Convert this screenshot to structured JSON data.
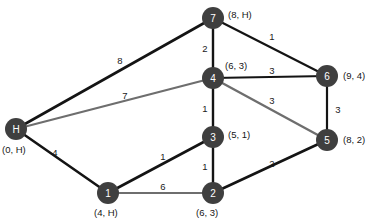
{
  "diagram": {
    "node_fill_color": "#3f3f3f",
    "node_text_color": "#ffffff",
    "label_text_color": "#161616",
    "edge_dark_color": "#141414",
    "edge_light_color": "#6e6e6e",
    "background_color": "#ffffff"
  },
  "nodes": [
    {
      "id": "H",
      "label": "H",
      "tuple": "(0, H)",
      "x": 16,
      "y": 129,
      "r": 11,
      "tuple_x": 2,
      "tuple_y": 153,
      "tuple_anchor": "start"
    },
    {
      "id": "7",
      "label": "7",
      "tuple": "(8, H)",
      "x": 213,
      "y": 18,
      "r": 11,
      "tuple_x": 228,
      "tuple_y": 18,
      "tuple_anchor": "start"
    },
    {
      "id": "4",
      "label": "4",
      "tuple": "(6, 3)",
      "x": 213,
      "y": 78,
      "r": 11,
      "tuple_x": 225,
      "tuple_y": 69,
      "tuple_anchor": "start"
    },
    {
      "id": "6",
      "label": "6",
      "tuple": "(9, 4)",
      "x": 327,
      "y": 76,
      "r": 11,
      "tuple_x": 343,
      "tuple_y": 79,
      "tuple_anchor": "start"
    },
    {
      "id": "5",
      "label": "5",
      "tuple": "(8, 2)",
      "x": 327,
      "y": 140,
      "r": 11,
      "tuple_x": 343,
      "tuple_y": 143,
      "tuple_anchor": "start"
    },
    {
      "id": "3",
      "label": "3",
      "tuple": "(5, 1)",
      "x": 213,
      "y": 137,
      "r": 11,
      "tuple_x": 228,
      "tuple_y": 138,
      "tuple_anchor": "start"
    },
    {
      "id": "1",
      "label": "1",
      "tuple": "(4, H)",
      "x": 108,
      "y": 193,
      "r": 11,
      "tuple_x": 94,
      "tuple_y": 216,
      "tuple_anchor": "start"
    },
    {
      "id": "2",
      "label": "2",
      "tuple": "(6, 3)",
      "x": 213,
      "y": 193,
      "r": 11,
      "tuple_x": 196,
      "tuple_y": 216,
      "tuple_anchor": "start"
    }
  ],
  "edges": [
    {
      "from": "H",
      "to": "7",
      "weight": "8",
      "style": "dark",
      "width": 2.6,
      "label_x": 120,
      "label_y": 60
    },
    {
      "from": "H",
      "to": "4",
      "weight": "7",
      "style": "light",
      "width": 2.2,
      "label_x": 125,
      "label_y": 95
    },
    {
      "from": "H",
      "to": "1",
      "weight": "4",
      "style": "dark",
      "width": 2.6,
      "label_x": 55,
      "label_y": 152
    },
    {
      "from": "7",
      "to": "4",
      "weight": "2",
      "style": "dark",
      "width": 2.4,
      "label_x": 205,
      "label_y": 48
    },
    {
      "from": "7",
      "to": "6",
      "weight": "1",
      "style": "dark",
      "width": 2.2,
      "label_x": 272,
      "label_y": 36
    },
    {
      "from": "4",
      "to": "6",
      "weight": "3",
      "style": "dark",
      "width": 2.2,
      "label_x": 272,
      "label_y": 70
    },
    {
      "from": "4",
      "to": "5",
      "weight": "3",
      "style": "light",
      "width": 2.4,
      "label_x": 272,
      "label_y": 100
    },
    {
      "from": "4",
      "to": "3",
      "weight": "1",
      "style": "dark",
      "width": 2.4,
      "label_x": 205,
      "label_y": 108
    },
    {
      "from": "6",
      "to": "5",
      "weight": "3",
      "style": "dark",
      "width": 2.2,
      "label_x": 338,
      "label_y": 109
    },
    {
      "from": "3",
      "to": "2",
      "weight": "1",
      "style": "dark",
      "width": 2.4,
      "label_x": 205,
      "label_y": 166
    },
    {
      "from": "3",
      "to": "1",
      "weight": "1",
      "style": "dark",
      "width": 2.6,
      "label_x": 163,
      "label_y": 156
    },
    {
      "from": "1",
      "to": "2",
      "weight": "6",
      "style": "light",
      "width": 2.2,
      "label_x": 163,
      "label_y": 186
    },
    {
      "from": "2",
      "to": "5",
      "weight": "2",
      "style": "dark",
      "width": 2.6,
      "label_x": 272,
      "label_y": 163
    }
  ]
}
